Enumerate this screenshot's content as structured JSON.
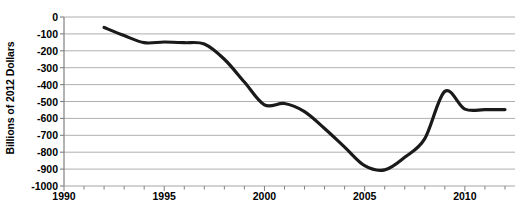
{
  "chart_data": {
    "type": "line",
    "title": "",
    "subtitle": "",
    "xlabel": "",
    "ylabel": "Billions of 2012 Dollars",
    "xlim": [
      1990,
      2012.5
    ],
    "ylim": [
      -1000,
      0
    ],
    "grid": true,
    "grid_axis": "y",
    "legend": "none",
    "line_color": "#1a1a1a",
    "line_width": 3.2,
    "gridline_color": "#a6a6a6",
    "axis_color": "#808080",
    "background": "#ffffff",
    "xticks": [
      1990,
      1995,
      2000,
      2005,
      2010
    ],
    "xtick_labels": [
      "1990",
      "1995",
      "2000",
      "2005",
      "2010"
    ],
    "xminor_tick_interval": 1,
    "yticks": [
      0,
      -100,
      -200,
      -300,
      -400,
      -500,
      -600,
      -700,
      -800,
      -900,
      -1000
    ],
    "ytick_labels": [
      "0",
      "-100",
      "-200",
      "-300",
      "-400",
      "-500",
      "-600",
      "-700",
      "-800",
      "-900",
      "-1000"
    ],
    "series": [
      {
        "name": "Trade Balance",
        "x": [
          1992,
          1993,
          1994,
          1995,
          1996,
          1997,
          1998,
          1999,
          2000,
          2001,
          2002,
          2003,
          2004,
          2005,
          2006,
          2007,
          2008,
          2009,
          2010,
          2011,
          2012
        ],
        "values": [
          -62,
          -110,
          -152,
          -148,
          -152,
          -160,
          -250,
          -385,
          -520,
          -512,
          -560,
          -660,
          -770,
          -880,
          -905,
          -830,
          -720,
          -440,
          -545,
          -548,
          -548
        ]
      }
    ],
    "annotations": []
  }
}
